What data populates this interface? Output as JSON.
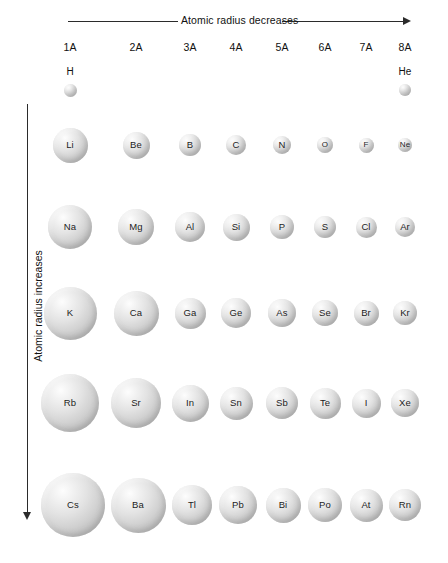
{
  "figure": {
    "top_axis_label": "Atomic radius decreases",
    "left_axis_label": "Atomic radius increases"
  },
  "groups": [
    {
      "label": "1A",
      "x": 70
    },
    {
      "label": "2A",
      "x": 136
    },
    {
      "label": "3A",
      "x": 190
    },
    {
      "label": "4A",
      "x": 236
    },
    {
      "label": "5A",
      "x": 282
    },
    {
      "label": "6A",
      "x": 325
    },
    {
      "label": "7A",
      "x": 366
    },
    {
      "label": "8A",
      "x": 405
    }
  ],
  "top_elements": [
    {
      "symbol": "H",
      "x": 70,
      "label_y": 66,
      "cy": 90,
      "d": 13
    },
    {
      "symbol": "He",
      "x": 405,
      "label_y": 66,
      "cy": 90,
      "d": 12
    }
  ],
  "chart_data": {
    "type": "bubble",
    "xlabel": "Atomic radius decreases",
    "ylabel": "Atomic radius increases",
    "categories": [
      "1A",
      "2A",
      "3A",
      "4A",
      "5A",
      "6A",
      "7A",
      "8A"
    ],
    "note": "Sphere diameter (px) is proportional to atomic radius",
    "rows": [
      {
        "period": 1,
        "cy": 90,
        "cells": [
          {
            "symbol": "H",
            "group": "1A",
            "cx": 70,
            "d": 13
          },
          {
            "symbol": "He",
            "group": "8A",
            "cx": 405,
            "d": 12
          }
        ]
      },
      {
        "period": 2,
        "cy": 145,
        "cells": [
          {
            "symbol": "Li",
            "group": "1A",
            "cx": 70,
            "d": 35
          },
          {
            "symbol": "Be",
            "group": "2A",
            "cx": 136,
            "d": 27
          },
          {
            "symbol": "B",
            "group": "3A",
            "cx": 190,
            "d": 22
          },
          {
            "symbol": "C",
            "group": "4A",
            "cx": 236,
            "d": 20
          },
          {
            "symbol": "N",
            "group": "5A",
            "cx": 282,
            "d": 18
          },
          {
            "symbol": "O",
            "group": "6A",
            "cx": 325,
            "d": 16
          },
          {
            "symbol": "F",
            "group": "7A",
            "cx": 366,
            "d": 15
          },
          {
            "symbol": "Ne",
            "group": "8A",
            "cx": 405,
            "d": 14
          }
        ]
      },
      {
        "period": 3,
        "cy": 227,
        "cells": [
          {
            "symbol": "Na",
            "group": "1A",
            "cx": 70,
            "d": 44
          },
          {
            "symbol": "Mg",
            "group": "2A",
            "cx": 136,
            "d": 36
          },
          {
            "symbol": "Al",
            "group": "3A",
            "cx": 190,
            "d": 30
          },
          {
            "symbol": "Si",
            "group": "4A",
            "cx": 236,
            "d": 27
          },
          {
            "symbol": "P",
            "group": "5A",
            "cx": 282,
            "d": 24
          },
          {
            "symbol": "S",
            "group": "6A",
            "cx": 325,
            "d": 22
          },
          {
            "symbol": "Cl",
            "group": "7A",
            "cx": 366,
            "d": 21
          },
          {
            "symbol": "Ar",
            "group": "8A",
            "cx": 405,
            "d": 20
          }
        ]
      },
      {
        "period": 4,
        "cy": 313,
        "cells": [
          {
            "symbol": "K",
            "group": "1A",
            "cx": 70,
            "d": 53
          },
          {
            "symbol": "Ca",
            "group": "2A",
            "cx": 136,
            "d": 45
          },
          {
            "symbol": "Ga",
            "group": "3A",
            "cx": 190,
            "d": 31
          },
          {
            "symbol": "Ge",
            "group": "4A",
            "cx": 236,
            "d": 30
          },
          {
            "symbol": "As",
            "group": "5A",
            "cx": 282,
            "d": 28
          },
          {
            "symbol": "Se",
            "group": "6A",
            "cx": 325,
            "d": 26
          },
          {
            "symbol": "Br",
            "group": "7A",
            "cx": 366,
            "d": 25
          },
          {
            "symbol": "Kr",
            "group": "8A",
            "cx": 405,
            "d": 24
          }
        ]
      },
      {
        "period": 5,
        "cy": 403,
        "cells": [
          {
            "symbol": "Rb",
            "group": "1A",
            "cx": 70,
            "d": 58
          },
          {
            "symbol": "Sr",
            "group": "2A",
            "cx": 136,
            "d": 50
          },
          {
            "symbol": "In",
            "group": "3A",
            "cx": 190,
            "d": 37
          },
          {
            "symbol": "Sn",
            "group": "4A",
            "cx": 236,
            "d": 33
          },
          {
            "symbol": "Sb",
            "group": "5A",
            "cx": 282,
            "d": 32
          },
          {
            "symbol": "Te",
            "group": "6A",
            "cx": 325,
            "d": 31
          },
          {
            "symbol": "I",
            "group": "7A",
            "cx": 366,
            "d": 29
          },
          {
            "symbol": "Xe",
            "group": "8A",
            "cx": 405,
            "d": 28
          }
        ]
      },
      {
        "period": 6,
        "cy": 505,
        "cells": [
          {
            "symbol": "Cs",
            "group": "1A",
            "cx": 73,
            "d": 64
          },
          {
            "symbol": "Ba",
            "group": "2A",
            "cx": 138,
            "d": 55
          },
          {
            "symbol": "Tl",
            "group": "3A",
            "cx": 192,
            "d": 40
          },
          {
            "symbol": "Pb",
            "group": "4A",
            "cx": 238,
            "d": 38
          },
          {
            "symbol": "Bi",
            "group": "5A",
            "cx": 283,
            "d": 35
          },
          {
            "symbol": "Po",
            "group": "6A",
            "cx": 325,
            "d": 34
          },
          {
            "symbol": "At",
            "group": "7A",
            "cx": 366,
            "d": 33
          },
          {
            "symbol": "Rn",
            "group": "8A",
            "cx": 405,
            "d": 32
          }
        ]
      }
    ]
  }
}
